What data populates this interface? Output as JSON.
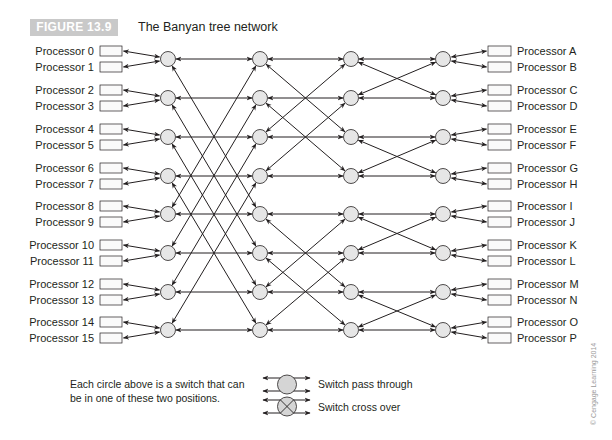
{
  "figure": {
    "label": "FIGURE 13.9",
    "title": "The Banyan tree network"
  },
  "left_processors": [
    "Processor 0",
    "Processor 1",
    "Processor 2",
    "Processor 3",
    "Processor 4",
    "Processor 5",
    "Processor 6",
    "Processor 7",
    "Processor 8",
    "Processor 9",
    "Processor 10",
    "Processor 11",
    "Processor 12",
    "Processor 13",
    "Processor 14",
    "Processor 15"
  ],
  "right_processors": [
    "Processor A",
    "Processor B",
    "Processor C",
    "Processor D",
    "Processor E",
    "Processor F",
    "Processor G",
    "Processor H",
    "Processor I",
    "Processor J",
    "Processor K",
    "Processor L",
    "Processor M",
    "Processor N",
    "Processor O",
    "Processor P"
  ],
  "network": {
    "switch_columns_x": [
      168,
      260,
      351,
      443
    ],
    "switch_rows_y": [
      59,
      98,
      137,
      176,
      214,
      253,
      292,
      330
    ],
    "stage_links": [
      {
        "from_col": 0,
        "to_col": 1,
        "cross_offset": 4,
        "description": "straight plus i <-> i+4"
      },
      {
        "from_col": 1,
        "to_col": 2,
        "cross_offset": 2,
        "description": "straight plus i <-> i+2 within groups of 4"
      },
      {
        "from_col": 2,
        "to_col": 3,
        "cross_offset": 1,
        "description": "straight plus i <-> i+1 within pairs"
      }
    ],
    "switch_fill": "#e6e6e6",
    "line_color": "#231f20"
  },
  "legend": {
    "description_line1": "Each circle above is a switch that can",
    "description_line2": "be in one of these two positions.",
    "pass_through_label": "Switch pass through",
    "cross_over_label": "Switch cross over"
  },
  "copyright": "© Cengage Learning 2014"
}
